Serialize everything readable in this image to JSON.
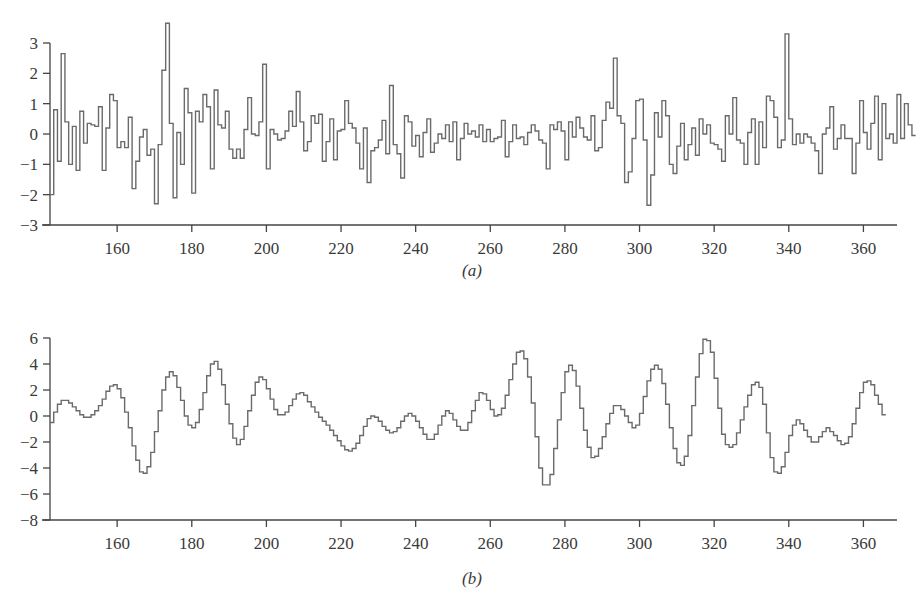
{
  "chart_data": [
    {
      "id": "a",
      "type": "line",
      "step": true,
      "label": "(a)",
      "title": "",
      "xlabel": "",
      "ylabel": "",
      "xlim": [
        142,
        369
      ],
      "ylim": [
        -3,
        3
      ],
      "xticks": [
        160,
        180,
        200,
        220,
        240,
        260,
        280,
        300,
        320,
        340,
        360
      ],
      "yticks": [
        -3,
        -2,
        -1,
        0,
        1,
        2,
        3
      ],
      "grid": false,
      "legend": null,
      "x_start": 142,
      "x_step": 1,
      "values": [
        -2.0,
        0.8,
        -0.9,
        2.65,
        0.4,
        -1.0,
        0.25,
        -1.2,
        0.75,
        -0.3,
        0.35,
        0.3,
        0.25,
        0.9,
        -1.2,
        0.2,
        1.3,
        1.1,
        -0.45,
        -0.25,
        -0.45,
        0.55,
        -1.8,
        -0.9,
        -0.1,
        0.15,
        -0.7,
        -0.5,
        -2.3,
        -0.35,
        2.1,
        3.65,
        0.35,
        -2.1,
        0.05,
        -1.0,
        1.5,
        0.7,
        -1.95,
        0.75,
        0.4,
        1.3,
        0.9,
        -1.15,
        1.45,
        0.3,
        0.2,
        0.75,
        -0.5,
        -0.8,
        -0.5,
        -0.8,
        0.15,
        1.2,
        0.0,
        -0.05,
        0.4,
        2.3,
        -1.15,
        0.15,
        0.0,
        -0.2,
        -0.15,
        0.1,
        0.75,
        0.25,
        1.4,
        0.4,
        -0.55,
        -0.25,
        0.6,
        0.35,
        0.65,
        -0.9,
        -0.25,
        0.5,
        -0.85,
        0.1,
        0.15,
        1.1,
        0.35,
        0.2,
        -0.3,
        -1.15,
        0.2,
        -1.6,
        -0.55,
        -0.45,
        -0.2,
        0.45,
        -0.65,
        1.6,
        -0.35,
        -0.65,
        -1.45,
        0.6,
        0.4,
        -0.4,
        -0.05,
        -0.75,
        0.05,
        0.5,
        -0.6,
        -0.3,
        0.0,
        -0.15,
        0.3,
        -0.25,
        0.4,
        -0.85,
        -0.15,
        0.35,
        0.0,
        0.1,
        -0.1,
        0.3,
        -0.25,
        0.15,
        -0.25,
        -0.15,
        -0.1,
        0.45,
        -0.75,
        -0.25,
        0.3,
        -0.15,
        -0.1,
        -0.35,
        0.05,
        0.3,
        0.1,
        -0.2,
        -0.3,
        -1.15,
        0.3,
        0.15,
        0.4,
        0.1,
        -0.85,
        0.4,
        -0.1,
        0.55,
        0.2,
        -0.1,
        -0.2,
        0.6,
        -0.55,
        -0.45,
        0.45,
        1.05,
        0.85,
        2.5,
        0.6,
        0.35,
        -1.6,
        -1.25,
        -0.15,
        1.1,
        1.15,
        -0.2,
        -2.35,
        -1.35,
        0.7,
        -0.1,
        1.1,
        0.6,
        -1.0,
        -1.3,
        -0.4,
        0.35,
        -0.85,
        -0.35,
        0.2,
        -0.7,
        0.5,
        0.0,
        0.3,
        -0.3,
        -0.35,
        -0.5,
        -0.9,
        0.6,
        0.0,
        1.2,
        -0.2,
        -0.3,
        -1.0,
        0.05,
        0.5,
        -1.0,
        0.4,
        -0.45,
        1.25,
        1.1,
        0.55,
        -0.45,
        -0.2,
        3.3,
        0.5,
        -0.35,
        0.0,
        -0.3,
        0.0,
        -0.1,
        -0.3,
        -0.55,
        -1.3,
        0.0,
        0.2,
        0.9,
        -0.5,
        -0.15,
        0.3,
        -0.15,
        -0.15,
        -1.3,
        -0.3,
        1.1,
        0.05,
        -0.5,
        0.35,
        1.25,
        -0.85,
        1.0,
        -0.15,
        0.0,
        -0.3,
        1.3,
        -0.15,
        1.0,
        0.3,
        -0.05
      ]
    },
    {
      "id": "b",
      "type": "line",
      "step": true,
      "label": "(b)",
      "title": "",
      "xlabel": "",
      "ylabel": "",
      "xlim": [
        142,
        369
      ],
      "ylim": [
        -8,
        6
      ],
      "xticks": [
        160,
        180,
        200,
        220,
        240,
        260,
        280,
        300,
        320,
        340,
        360
      ],
      "yticks": [
        -8,
        -6,
        -4,
        -2,
        0,
        2,
        4,
        6
      ],
      "grid": false,
      "legend": null,
      "x_start": 142,
      "x_step": 1,
      "values": [
        -0.5,
        0.3,
        0.9,
        1.2,
        1.2,
        1.0,
        0.7,
        0.4,
        0.1,
        -0.1,
        -0.1,
        0.1,
        0.4,
        0.8,
        1.3,
        1.9,
        2.3,
        2.4,
        2.1,
        1.4,
        0.3,
        -0.9,
        -2.3,
        -3.4,
        -4.3,
        -4.4,
        -3.9,
        -2.8,
        -1.2,
        0.4,
        2.0,
        3.0,
        3.4,
        3.1,
        2.2,
        1.2,
        0.0,
        -0.7,
        -0.9,
        -0.5,
        0.5,
        1.8,
        3.1,
        4.0,
        4.2,
        3.6,
        2.4,
        0.9,
        -0.6,
        -1.7,
        -2.2,
        -1.8,
        -0.8,
        0.4,
        1.6,
        2.6,
        3.0,
        2.8,
        2.1,
        1.3,
        0.5,
        0.1,
        0.1,
        0.3,
        0.8,
        1.3,
        1.7,
        1.8,
        1.6,
        1.1,
        0.7,
        0.3,
        -0.1,
        -0.4,
        -0.7,
        -1.1,
        -1.5,
        -1.9,
        -2.3,
        -2.6,
        -2.7,
        -2.5,
        -2.1,
        -1.5,
        -0.8,
        -0.2,
        0.0,
        -0.1,
        -0.4,
        -0.8,
        -1.1,
        -1.3,
        -1.2,
        -0.9,
        -0.4,
        0.0,
        0.2,
        0.0,
        -0.4,
        -0.9,
        -1.4,
        -1.8,
        -1.8,
        -1.4,
        -0.7,
        0.0,
        0.4,
        0.2,
        -0.3,
        -0.8,
        -1.1,
        -1.1,
        -0.5,
        0.4,
        1.2,
        1.8,
        1.7,
        1.2,
        0.5,
        0.0,
        0.1,
        0.6,
        1.6,
        2.8,
        4.0,
        4.9,
        5.0,
        4.4,
        3.0,
        1.0,
        -1.6,
        -4.0,
        -5.3,
        -5.3,
        -4.5,
        -2.5,
        -0.3,
        1.8,
        3.4,
        3.9,
        3.5,
        2.3,
        0.6,
        -1.1,
        -2.4,
        -3.2,
        -3.1,
        -2.5,
        -1.6,
        -0.6,
        0.2,
        0.8,
        0.8,
        0.5,
        0.0,
        -0.5,
        -0.9,
        -0.7,
        0.2,
        1.5,
        2.7,
        3.6,
        3.9,
        3.6,
        2.5,
        0.9,
        -0.9,
        -2.5,
        -3.6,
        -3.8,
        -3.1,
        -1.5,
        0.8,
        3.0,
        4.8,
        5.9,
        5.8,
        4.9,
        2.9,
        0.6,
        -1.4,
        -2.2,
        -2.4,
        -2.2,
        -1.3,
        -0.3,
        0.7,
        1.6,
        2.4,
        2.6,
        2.2,
        0.9,
        -1.3,
        -3.2,
        -4.3,
        -4.4,
        -3.9,
        -2.8,
        -1.5,
        -0.7,
        -0.3,
        -0.6,
        -1.1,
        -1.6,
        -2.0,
        -2.0,
        -1.6,
        -1.2,
        -0.9,
        -1.2,
        -1.5,
        -1.9,
        -2.2,
        -2.1,
        -1.6,
        -0.6,
        0.6,
        1.8,
        2.6,
        2.7,
        2.4,
        1.6,
        0.9,
        0.1
      ]
    }
  ],
  "panels": {
    "a": {
      "label": "(a)"
    },
    "b": {
      "label": "(b)"
    }
  }
}
